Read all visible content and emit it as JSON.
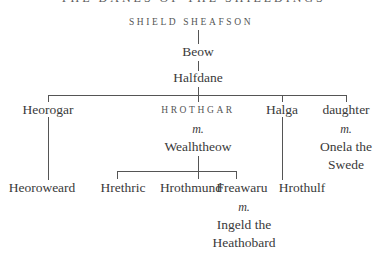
{
  "title": "THE DANES OF THE SHIELDINGS",
  "tree": {
    "root": "SHIELD SHEAFSON",
    "gen1": "Beow",
    "gen2": "Halfdane",
    "gen3": {
      "heorogar": "Heorogar",
      "hrothgar": "HROTHGAR",
      "hrothgar_marriage": "m.",
      "hrothgar_spouse": "Wealhtheow",
      "halga": "Halga",
      "daughter": "daughter",
      "daughter_marriage": "m.",
      "daughter_spouse_line1": "Onela the",
      "daughter_spouse_line2": "Swede"
    },
    "gen4": {
      "heoroweard": "Heoroweard",
      "hrethric": "Hrethric",
      "hrothmund": "Hrothmund",
      "freawaru": "Freawaru",
      "freawaru_marriage": "m.",
      "freawaru_spouse_line1": "Ingeld the",
      "freawaru_spouse_line2": "Heathobard",
      "hrothulf": "Hrothulf"
    }
  },
  "colors": {
    "text": "#3a3a3a",
    "lines": "#555555"
  }
}
